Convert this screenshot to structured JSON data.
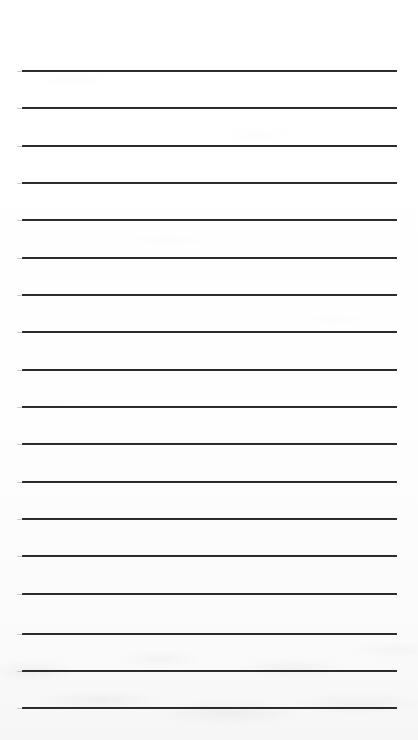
{
  "document": {
    "kind": "scanned-lined-paper",
    "title": "Blank Ruled Paper Scan",
    "description": "A scanned blank sheet of ruled notebook paper with evenly spaced horizontal writing lines and no handwriting or printed text.",
    "page_width": 418,
    "page_height": 740,
    "background_color": "#fdfdfd",
    "rule_color": "#2a2a2c",
    "rule_thickness": 2,
    "rule_left": 22,
    "rule_right": 397,
    "rule_length": 375,
    "first_rule_y": 70,
    "rule_spacing": 37.4,
    "rule_count": 18,
    "has_margin_rule": false,
    "has_text_content": false,
    "visible_text": "",
    "rules": [
      {
        "index": 1,
        "y": 70
      },
      {
        "index": 2,
        "y": 107
      },
      {
        "index": 3,
        "y": 145
      },
      {
        "index": 4,
        "y": 182
      },
      {
        "index": 5,
        "y": 219
      },
      {
        "index": 6,
        "y": 257
      },
      {
        "index": 7,
        "y": 294
      },
      {
        "index": 8,
        "y": 331
      },
      {
        "index": 9,
        "y": 369
      },
      {
        "index": 10,
        "y": 406
      },
      {
        "index": 11,
        "y": 443
      },
      {
        "index": 12,
        "y": 481
      },
      {
        "index": 13,
        "y": 518
      },
      {
        "index": 14,
        "y": 555
      },
      {
        "index": 15,
        "y": 593
      },
      {
        "index": 16,
        "y": 633
      },
      {
        "index": 17,
        "y": 670
      },
      {
        "index": 18,
        "y": 707
      }
    ]
  }
}
